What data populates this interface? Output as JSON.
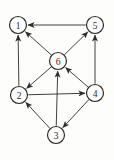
{
  "figure": {
    "type": "directed-graph",
    "background_color": "#fdfdfc",
    "stroke_color": "#2b2b2b",
    "node_fill_color": "#fdfdfc",
    "node_radius": 8.5,
    "node_stroke_width": 1.2,
    "edge_stroke_width": 0.9,
    "label_font_size": 9.5,
    "nodes": [
      {
        "id": "1",
        "label": "1",
        "x": 18,
        "y": 25
      },
      {
        "id": "2",
        "label": "2",
        "x": 19,
        "y": 95
      },
      {
        "id": "3",
        "label": "3",
        "x": 56,
        "y": 135
      },
      {
        "id": "4",
        "label": "4",
        "x": 95,
        "y": 93
      },
      {
        "id": "5",
        "label": "5",
        "x": 95,
        "y": 25
      },
      {
        "id": "6",
        "label": "6",
        "x": 58,
        "y": 61
      }
    ],
    "edges": [
      {
        "from": "5",
        "to": "1"
      },
      {
        "from": "6",
        "to": "1"
      },
      {
        "from": "2",
        "to": "1"
      },
      {
        "from": "6",
        "to": "5"
      },
      {
        "from": "4",
        "to": "5"
      },
      {
        "from": "6",
        "to": "2"
      },
      {
        "from": "3",
        "to": "6"
      },
      {
        "from": "4",
        "to": "6"
      },
      {
        "from": "2",
        "to": "4"
      },
      {
        "from": "3",
        "to": "2"
      },
      {
        "from": "4",
        "to": "3"
      }
    ]
  }
}
